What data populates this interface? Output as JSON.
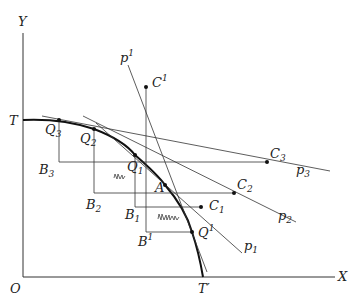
{
  "diagram": {
    "axes": {
      "y_label": "Y",
      "x_label": "X",
      "origin_label": "O"
    },
    "curve_labels": {
      "start": "T",
      "end": "T′"
    },
    "points": {
      "Q3": {
        "base": "Q",
        "sub": "3"
      },
      "Q2": {
        "base": "Q",
        "sub": "2"
      },
      "Q1": {
        "base": "Q",
        "sub": "1"
      },
      "A": {
        "base": "A"
      },
      "Qsup1": {
        "base": "Q",
        "sup": "1"
      },
      "B3": {
        "base": "B",
        "sub": "3"
      },
      "B2": {
        "base": "B",
        "sub": "2"
      },
      "B1": {
        "base": "B",
        "sub": "1"
      },
      "Bsup1": {
        "base": "B",
        "sup": "1"
      },
      "C3": {
        "base": "C",
        "sub": "3"
      },
      "C2": {
        "base": "C",
        "sub": "2"
      },
      "C1": {
        "base": "C",
        "sub": "1"
      },
      "Csup1": {
        "base": "C",
        "sup": "1"
      }
    },
    "price_lines": {
      "p3": {
        "base": "p",
        "sub": "3"
      },
      "p2": {
        "base": "p",
        "sub": "2"
      },
      "p1": {
        "base": "p",
        "sub": "1"
      },
      "psup1": {
        "base": "p",
        "sup": "1"
      }
    }
  }
}
